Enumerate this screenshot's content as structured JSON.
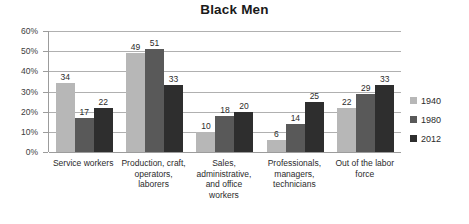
{
  "chart_data": {
    "type": "bar",
    "title": "Black Men",
    "xlabel": "",
    "ylabel": "",
    "ylim": [
      0,
      60
    ],
    "ytick_labels": [
      "0%",
      "10%",
      "20%",
      "30%",
      "40%",
      "50%",
      "60%"
    ],
    "ytick_values": [
      0,
      10,
      20,
      30,
      40,
      50,
      60
    ],
    "grid": true,
    "legend_position": "right",
    "value_suffix": "%",
    "categories": [
      "Service workers",
      "Production, craft, operators, laborers",
      "Sales, administrative, and office workers",
      "Professionals, managers, technicians",
      "Out of the labor force"
    ],
    "category_lines": [
      [
        "Service workers"
      ],
      [
        "Production, craft,",
        "operators,",
        "laborers"
      ],
      [
        "Sales,",
        "administrative,",
        "and office",
        "workers"
      ],
      [
        "Professionals,",
        "managers,",
        "technicians"
      ],
      [
        "Out of the labor",
        "force"
      ]
    ],
    "series": [
      {
        "name": "1940",
        "color": "#b7b7b7",
        "values": [
          34,
          49,
          10,
          6,
          22
        ]
      },
      {
        "name": "1980",
        "color": "#595959",
        "values": [
          17,
          51,
          18,
          14,
          29
        ]
      },
      {
        "name": "2012",
        "color": "#2e2e2e",
        "values": [
          22,
          33,
          20,
          25,
          33
        ]
      }
    ]
  },
  "colors": {
    "background": "#ffffff",
    "gridline": "#b0b0b0",
    "axis": "#9c9c9c",
    "text": "#2b2b2b",
    "title": "#1a1a1a"
  }
}
